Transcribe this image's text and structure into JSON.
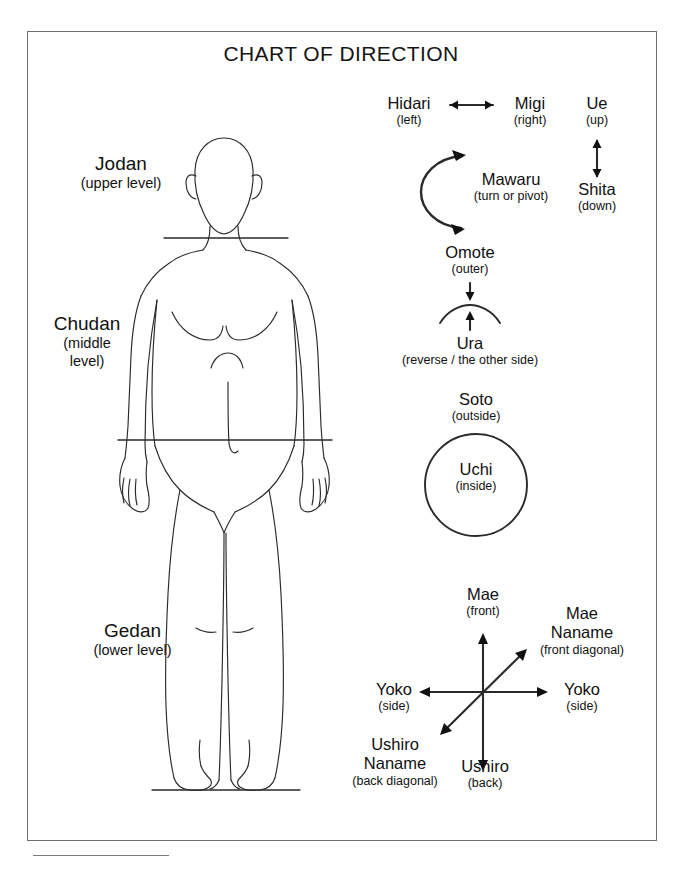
{
  "document": {
    "title": "CHART OF DIRECTION",
    "has_border_frame": true,
    "has_footnote_rule": true
  },
  "body_levels": [
    {
      "id": "jodan",
      "jp": "Jodan",
      "en": "(upper level)"
    },
    {
      "id": "chudan",
      "jp": "Chudan",
      "en_line1": "(middle",
      "en_line2": "level)"
    },
    {
      "id": "gedan",
      "jp": "Gedan",
      "en": "(lower level)"
    }
  ],
  "figure": {
    "name": "human-body-outline",
    "guide_lines": [
      "shoulder-level-line",
      "waist-level-line",
      "ground-line"
    ]
  },
  "directions": {
    "horizontal_pair": {
      "left": {
        "jp": "Hidari",
        "en": "(left)"
      },
      "right": {
        "jp": "Migi",
        "en": "(right)"
      },
      "arrow": "double-headed-horizontal-arrow"
    },
    "vertical_pair": {
      "top": {
        "jp": "Ue",
        "en": "(up)"
      },
      "bottom": {
        "jp": "Shita",
        "en": "(down)"
      },
      "arrow": "double-headed-vertical-arrow"
    },
    "rotation": {
      "jp": "Mawaru",
      "en": "(turn or pivot)",
      "arrow": "curved-double-headed-arc-arrow"
    },
    "sides": {
      "outer": {
        "jp": "Omote",
        "en": "(outer)"
      },
      "inner": {
        "jp": "Ura",
        "en": "(reverse / the other side)"
      },
      "arrow_down": "down-arrow",
      "arrow_up": "up-arrow",
      "shape": "arc-surface"
    },
    "inside_outside": {
      "outside": {
        "jp": "Soto",
        "en": "(outside)"
      },
      "inside": {
        "jp": "Uchi",
        "en": "(inside)"
      },
      "shape": "circle"
    },
    "compass": {
      "front": {
        "jp": "Mae",
        "en": "(front)"
      },
      "back": {
        "jp": "Ushiro",
        "en": "(back)"
      },
      "side_left": {
        "jp": "Yoko",
        "en": "(side)"
      },
      "side_right": {
        "jp": "Yoko",
        "en": "(side)"
      },
      "front_diagonal": {
        "jp_line1": "Mae",
        "jp_line2": "Naname",
        "en": "(front diagonal)"
      },
      "back_diagonal": {
        "jp_line1": "Ushiro",
        "jp_line2": "Naname",
        "en": "(back diagonal)"
      },
      "arrows": [
        "vertical-double-arrow",
        "horizontal-double-arrow",
        "diagonal-double-arrow"
      ]
    }
  },
  "colors": {
    "ink": "#111111",
    "frame": "#6f6f6f",
    "line": "#2a2a2a"
  }
}
